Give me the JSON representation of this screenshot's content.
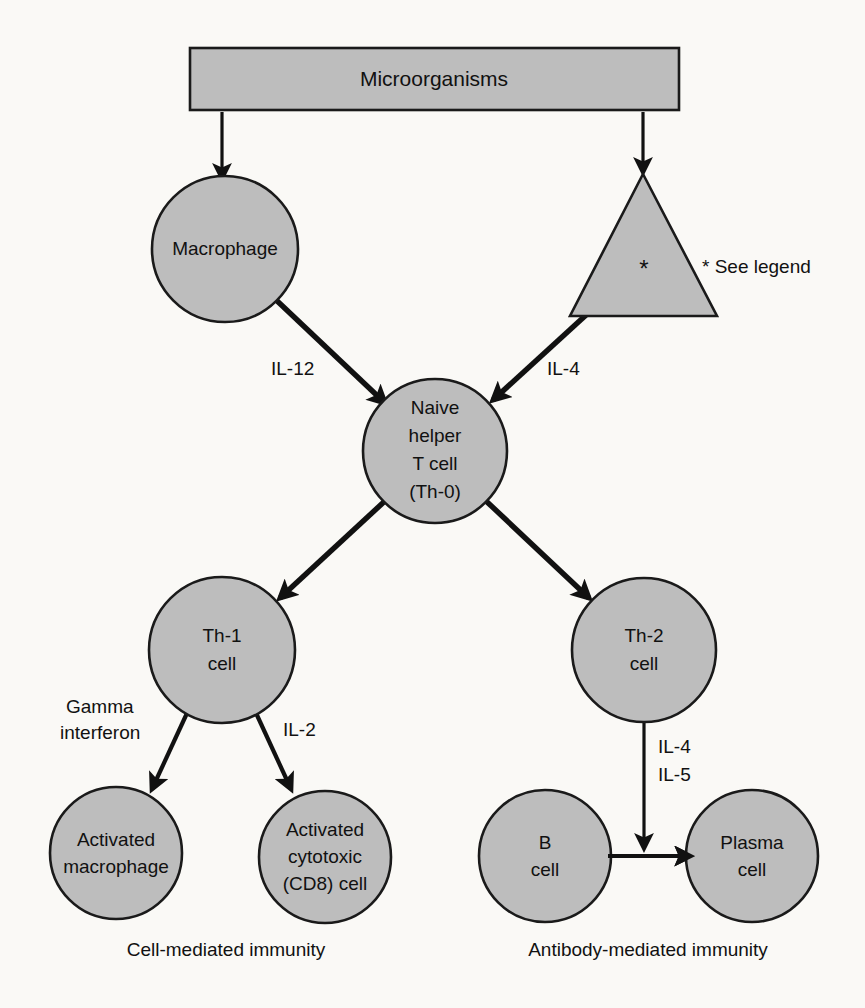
{
  "figure": {
    "title": "Microorganisms",
    "background_color": "#faf9f6",
    "shape_fill_color": "#bdbdbd",
    "shape_stroke_color": "#1a1a1a",
    "line_color": "#111111"
  },
  "nodes": {
    "microorganisms": {
      "label": "Microorganisms",
      "shape": "rectangle"
    },
    "macrophage": {
      "label": "Macrophage",
      "shape": "circle"
    },
    "antigen_presenting_triangle": {
      "label": "*",
      "shape": "triangle"
    },
    "naive_helper_t": {
      "shape": "circle",
      "line1": "Naive",
      "line2": "helper",
      "line3": "T cell",
      "line4": "(Th-0)"
    },
    "th1": {
      "shape": "circle",
      "line1": "Th-1",
      "line2": "cell"
    },
    "th2": {
      "shape": "circle",
      "line1": "Th-2",
      "line2": "cell"
    },
    "activated_macrophage": {
      "shape": "circle",
      "line1": "Activated",
      "line2": "macrophage"
    },
    "activated_cytotoxic": {
      "shape": "circle",
      "line1": "Activated",
      "line2": "cytotoxic",
      "line3": "(CD8) cell"
    },
    "b_cell": {
      "shape": "circle",
      "line1": "B",
      "line2": "cell"
    },
    "plasma_cell": {
      "shape": "circle",
      "line1": "Plasma",
      "line2": "cell"
    }
  },
  "edge_labels": {
    "il12": "IL-12",
    "il4_top": "IL-4",
    "gamma_interferon_line1": "Gamma",
    "gamma_interferon_line2": "interferon",
    "il2": "IL-2",
    "il4_bottom": "IL-4",
    "il5_bottom": "IL-5"
  },
  "annotations": {
    "see_legend": "* See legend"
  },
  "captions": {
    "cell_mediated": "Cell-mediated immunity",
    "antibody_mediated": "Antibody-mediated immunity"
  }
}
